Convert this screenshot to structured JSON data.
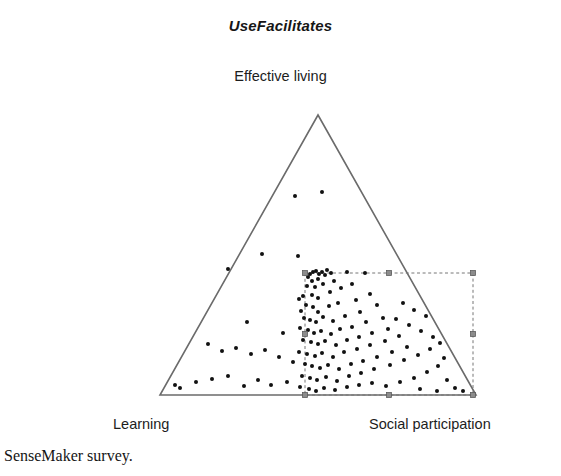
{
  "chart": {
    "title": "UseFacilitates",
    "apex_label": "Effective living",
    "left_vertex_label": "Learning",
    "right_vertex_label": "Social participation",
    "caption": "SenseMaker survey."
  },
  "chart_data": {
    "type": "scatter",
    "plot_style": "ternary",
    "title": "UseFacilitates",
    "xlabel": "",
    "ylabel": "",
    "grid": false,
    "legend": null,
    "axes": [
      {
        "name": "Effective living",
        "position": "top-apex"
      },
      {
        "name": "Learning",
        "position": "bottom-left"
      },
      {
        "name": "Social participation",
        "position": "bottom-right"
      }
    ],
    "triangle_vertices_px": {
      "apex": [
        318,
        115
      ],
      "bottom_left": [
        160,
        395
      ],
      "bottom_right": [
        476,
        395
      ]
    },
    "marker_color": "#111111",
    "marker_size_px": 4,
    "triangle_line_color": "#6b6b6b",
    "selection_rect": {
      "x0": 305,
      "y0": 273,
      "x1": 473,
      "y1": 395,
      "style": "dashed",
      "line_color": "#777777",
      "handle_color": "#8c8c8c",
      "handles": [
        [
          305,
          273
        ],
        [
          389,
          273
        ],
        [
          473,
          273
        ],
        [
          305,
          334
        ],
        [
          473,
          334
        ],
        [
          305,
          395
        ],
        [
          389,
          395
        ],
        [
          473,
          395
        ]
      ]
    },
    "points_px": [
      [
        295,
        196
      ],
      [
        322,
        192
      ],
      [
        228,
        269
      ],
      [
        262,
        254
      ],
      [
        247,
        322
      ],
      [
        283,
        333
      ],
      [
        298,
        256
      ],
      [
        310,
        274
      ],
      [
        313,
        272
      ],
      [
        316,
        271
      ],
      [
        319,
        274
      ],
      [
        322,
        272
      ],
      [
        325,
        275
      ],
      [
        308,
        277
      ],
      [
        318,
        279
      ],
      [
        312,
        281
      ],
      [
        327,
        270
      ],
      [
        331,
        273
      ],
      [
        307,
        286
      ],
      [
        315,
        287
      ],
      [
        323,
        284
      ],
      [
        334,
        281
      ],
      [
        303,
        296
      ],
      [
        299,
        299
      ],
      [
        312,
        295
      ],
      [
        318,
        298
      ],
      [
        330,
        292
      ],
      [
        341,
        288
      ],
      [
        352,
        284
      ],
      [
        365,
        273
      ],
      [
        347,
        272
      ],
      [
        306,
        305
      ],
      [
        313,
        307
      ],
      [
        301,
        311
      ],
      [
        318,
        312
      ],
      [
        329,
        306
      ],
      [
        338,
        303
      ],
      [
        356,
        300
      ],
      [
        370,
        294
      ],
      [
        304,
        318
      ],
      [
        310,
        320
      ],
      [
        316,
        322
      ],
      [
        323,
        317
      ],
      [
        333,
        321
      ],
      [
        345,
        316
      ],
      [
        360,
        312
      ],
      [
        377,
        305
      ],
      [
        300,
        328
      ],
      [
        308,
        330
      ],
      [
        314,
        333
      ],
      [
        321,
        331
      ],
      [
        331,
        334
      ],
      [
        340,
        329
      ],
      [
        352,
        327
      ],
      [
        366,
        322
      ],
      [
        383,
        318
      ],
      [
        303,
        340
      ],
      [
        311,
        342
      ],
      [
        318,
        344
      ],
      [
        325,
        341
      ],
      [
        336,
        345
      ],
      [
        347,
        340
      ],
      [
        359,
        337
      ],
      [
        372,
        333
      ],
      [
        388,
        329
      ],
      [
        299,
        352
      ],
      [
        307,
        354
      ],
      [
        315,
        356
      ],
      [
        322,
        353
      ],
      [
        333,
        357
      ],
      [
        344,
        352
      ],
      [
        357,
        349
      ],
      [
        370,
        345
      ],
      [
        385,
        341
      ],
      [
        399,
        336
      ],
      [
        305,
        364
      ],
      [
        312,
        366
      ],
      [
        320,
        368
      ],
      [
        328,
        365
      ],
      [
        339,
        369
      ],
      [
        351,
        364
      ],
      [
        363,
        361
      ],
      [
        377,
        357
      ],
      [
        392,
        352
      ],
      [
        407,
        347
      ],
      [
        302,
        376
      ],
      [
        310,
        378
      ],
      [
        317,
        380
      ],
      [
        326,
        377
      ],
      [
        337,
        381
      ],
      [
        349,
        376
      ],
      [
        361,
        373
      ],
      [
        374,
        369
      ],
      [
        390,
        365
      ],
      [
        404,
        360
      ],
      [
        418,
        355
      ],
      [
        430,
        349
      ],
      [
        300,
        387
      ],
      [
        309,
        389
      ],
      [
        316,
        391
      ],
      [
        324,
        388
      ],
      [
        335,
        390
      ],
      [
        347,
        387
      ],
      [
        359,
        385
      ],
      [
        372,
        383
      ],
      [
        386,
        386
      ],
      [
        400,
        382
      ],
      [
        414,
        378
      ],
      [
        427,
        372
      ],
      [
        438,
        366
      ],
      [
        444,
        358
      ],
      [
        396,
        319
      ],
      [
        409,
        325
      ],
      [
        421,
        331
      ],
      [
        433,
        337
      ],
      [
        440,
        343
      ],
      [
        414,
        310
      ],
      [
        426,
        316
      ],
      [
        403,
        303
      ],
      [
        180,
        388
      ],
      [
        175,
        385
      ],
      [
        196,
        382
      ],
      [
        212,
        379
      ],
      [
        228,
        376
      ],
      [
        244,
        386
      ],
      [
        258,
        380
      ],
      [
        271,
        385
      ],
      [
        287,
        382
      ],
      [
        208,
        344
      ],
      [
        222,
        351
      ],
      [
        236,
        348
      ],
      [
        251,
        354
      ],
      [
        265,
        350
      ],
      [
        279,
        357
      ],
      [
        293,
        362
      ],
      [
        455,
        388
      ],
      [
        463,
        391
      ],
      [
        447,
        380
      ],
      [
        437,
        391
      ],
      [
        420,
        389
      ]
    ]
  }
}
